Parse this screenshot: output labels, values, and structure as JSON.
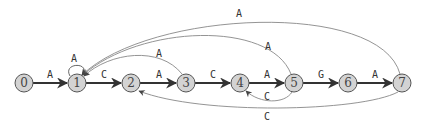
{
  "diagram": {
    "type": "automaton",
    "nodes": [
      {
        "id": "0",
        "label": "0",
        "x": 24,
        "y": 83
      },
      {
        "id": "1",
        "label": "1",
        "x": 77,
        "y": 83
      },
      {
        "id": "2",
        "label": "2",
        "x": 131,
        "y": 83
      },
      {
        "id": "3",
        "label": "3",
        "x": 186,
        "y": 83
      },
      {
        "id": "4",
        "label": "4",
        "x": 240,
        "y": 83
      },
      {
        "id": "5",
        "label": "5",
        "x": 294,
        "y": 83
      },
      {
        "id": "6",
        "label": "6",
        "x": 348,
        "y": 83
      },
      {
        "id": "7",
        "label": "7",
        "x": 402,
        "y": 83
      }
    ],
    "edges": [
      {
        "from": "0",
        "to": "1",
        "label": "A",
        "kind": "forward"
      },
      {
        "from": "1",
        "to": "2",
        "label": "C",
        "kind": "forward"
      },
      {
        "from": "2",
        "to": "3",
        "label": "A",
        "kind": "forward"
      },
      {
        "from": "3",
        "to": "4",
        "label": "C",
        "kind": "forward"
      },
      {
        "from": "4",
        "to": "5",
        "label": "A",
        "kind": "forward"
      },
      {
        "from": "5",
        "to": "6",
        "label": "G",
        "kind": "forward"
      },
      {
        "from": "6",
        "to": "7",
        "label": "A",
        "kind": "forward"
      },
      {
        "from": "1",
        "to": "1",
        "label": "A",
        "kind": "self-loop"
      },
      {
        "from": "3",
        "to": "1",
        "label": "A",
        "kind": "back"
      },
      {
        "from": "5",
        "to": "1",
        "label": "A",
        "kind": "back"
      },
      {
        "from": "7",
        "to": "1",
        "label": "A",
        "kind": "back"
      },
      {
        "from": "5",
        "to": "4",
        "label": "C",
        "kind": "back"
      },
      {
        "from": "7",
        "to": "2",
        "label": "C",
        "kind": "back"
      }
    ],
    "colors": {
      "node_fill": "#d3d3d3",
      "node_stroke": "#555555",
      "forward_edge": "#333333",
      "back_edge": "#888888"
    }
  }
}
